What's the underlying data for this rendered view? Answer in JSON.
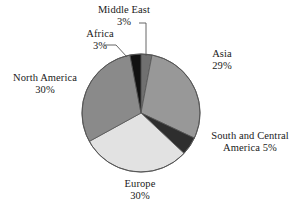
{
  "chart_data": {
    "type": "pie",
    "title": "",
    "subtitle": "",
    "xlabel": "",
    "ylabel": "",
    "legend_position": "none",
    "grid": false,
    "label_format": "name above percent",
    "start_angle_deg": 0,
    "direction": "clockwise",
    "categories": [
      "Middle East",
      "Asia",
      "South and Central America",
      "Europe",
      "North America",
      "Africa"
    ],
    "values": [
      3,
      29,
      5,
      30,
      30,
      3
    ],
    "units": "%",
    "slices": [
      {
        "name": "Middle East",
        "value": 3,
        "percent_text": "3%",
        "label_line1": "Middle East",
        "label_line2": "3%",
        "color": "#707070",
        "leader_line": true
      },
      {
        "name": "Asia",
        "value": 29,
        "percent_text": "29%",
        "label_line1": "Asia",
        "label_line2": "29%",
        "color": "#989898",
        "leader_line": false
      },
      {
        "name": "South and Central America",
        "value": 5,
        "percent_text": "5%",
        "label_line1": "South and Central",
        "label_line2": "America 5%",
        "color": "#2e2e2e",
        "leader_line": false
      },
      {
        "name": "Europe",
        "value": 30,
        "percent_text": "30%",
        "label_line1": "Europe",
        "label_line2": "30%",
        "color": "#e2e2e2",
        "leader_line": false
      },
      {
        "name": "North America",
        "value": 30,
        "percent_text": "30%",
        "label_line1": "North America",
        "label_line2": "30%",
        "color": "#8a8a8a",
        "leader_line": false
      },
      {
        "name": "Africa",
        "value": 3,
        "percent_text": "3%",
        "label_line1": "Africa",
        "label_line2": "3%",
        "color": "#111111",
        "leader_line": true
      }
    ],
    "colors": {
      "background": "#ffffff",
      "outline": "#555555",
      "text": "#1a1a1a",
      "leader": "#555555"
    },
    "geometry": {
      "center_x": 141,
      "center_y": 113,
      "radius": 59
    }
  }
}
